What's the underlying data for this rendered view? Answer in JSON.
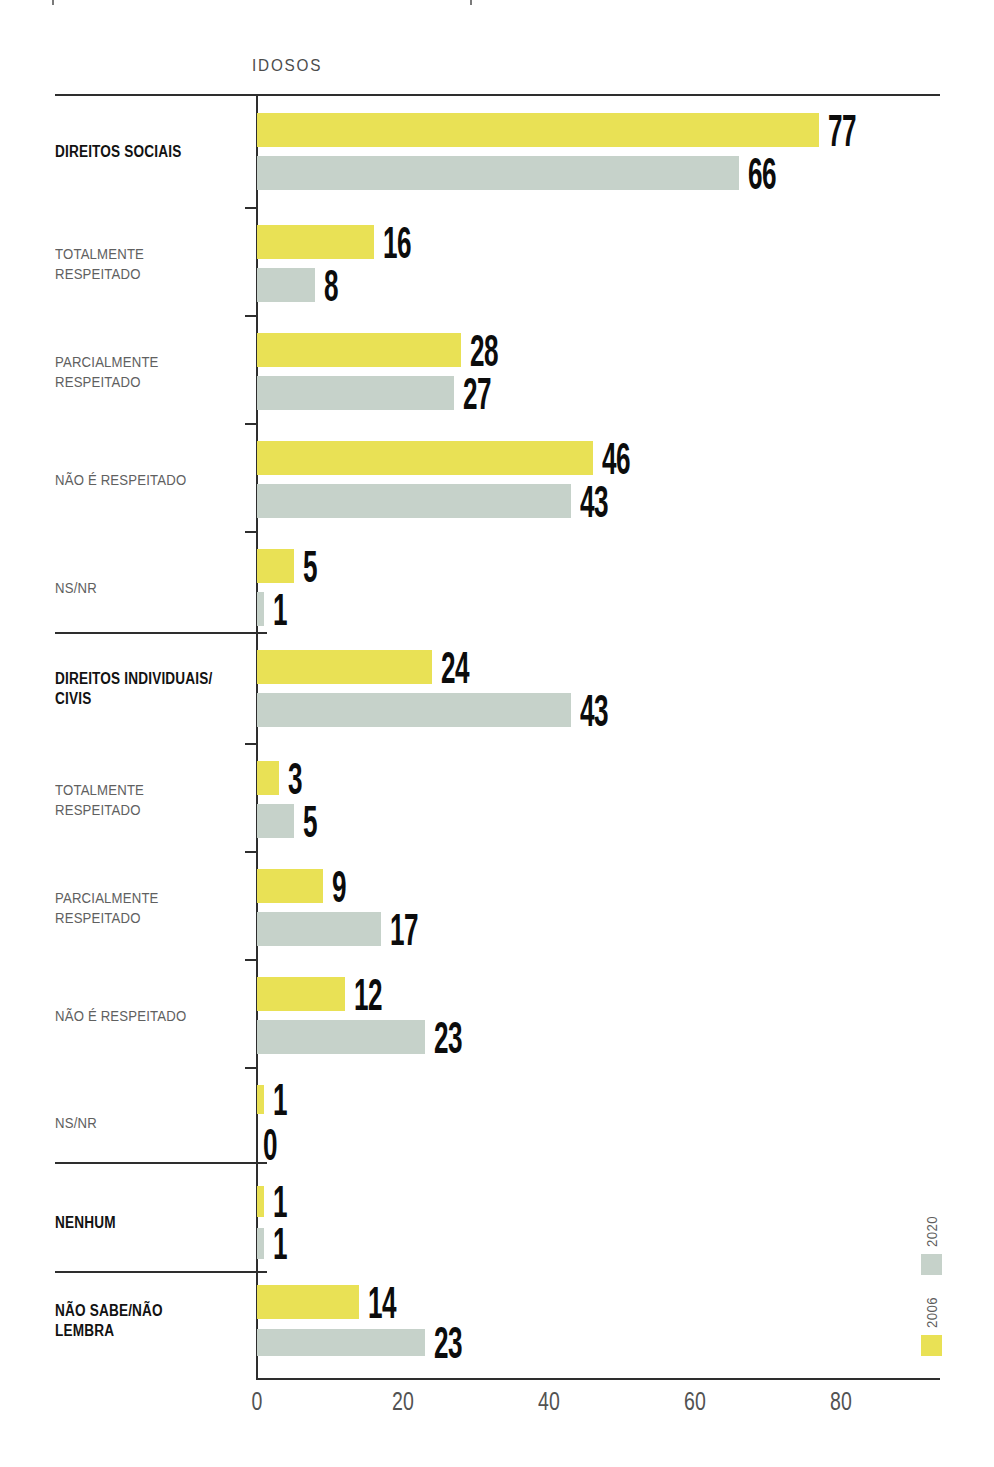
{
  "page": {
    "title": "IDOSOS"
  },
  "legend": {
    "items": [
      {
        "label": "2020",
        "color": "#c6d2ca"
      },
      {
        "label": "2006",
        "color": "#e9e155"
      }
    ]
  },
  "x_axis": {
    "tick_labels": [
      "0",
      "20",
      "40",
      "60",
      "80"
    ],
    "tick_values": [
      0,
      20,
      40,
      60,
      80
    ]
  },
  "chart_data": {
    "type": "bar",
    "orientation": "horizontal",
    "title": "IDOSOS",
    "xlabel": "",
    "ylabel": "",
    "units": "percent",
    "xlim": [
      0,
      93
    ],
    "x_ticks": [
      0,
      20,
      40,
      60,
      80
    ],
    "grid": false,
    "legend_position": "right-bottom-rotated",
    "bar_order_within_group_top_to_bottom": [
      "2006",
      "2020"
    ],
    "series": [
      {
        "name": "2006",
        "color": "#e9e155",
        "values": [
          77,
          16,
          28,
          46,
          5,
          24,
          3,
          9,
          12,
          1,
          1,
          14
        ]
      },
      {
        "name": "2020",
        "color": "#c6d2ca",
        "values": [
          66,
          8,
          27,
          43,
          1,
          43,
          5,
          17,
          23,
          0,
          1,
          23
        ]
      }
    ],
    "rows": [
      {
        "label": "DIREITOS SOCIAIS",
        "bold": true,
        "section_start": false,
        "values": {
          "2006": 77,
          "2020": 66
        }
      },
      {
        "label": "TOTALMENTE\nRESPEITADO",
        "bold": false,
        "section_start": false,
        "values": {
          "2006": 16,
          "2020": 8
        }
      },
      {
        "label": "PARCIALMENTE\nRESPEITADO",
        "bold": false,
        "section_start": false,
        "values": {
          "2006": 28,
          "2020": 27
        }
      },
      {
        "label": "NÃO É RESPEITADO",
        "bold": false,
        "section_start": false,
        "values": {
          "2006": 46,
          "2020": 43
        }
      },
      {
        "label": "NS/NR",
        "bold": false,
        "section_start": false,
        "values": {
          "2006": 5,
          "2020": 1
        }
      },
      {
        "label": "DIREITOS INDIVIDUAIS/\nCIVIS",
        "bold": true,
        "section_start": true,
        "values": {
          "2006": 24,
          "2020": 43
        }
      },
      {
        "label": "TOTALMENTE\nRESPEITADO",
        "bold": false,
        "section_start": false,
        "values": {
          "2006": 3,
          "2020": 5
        }
      },
      {
        "label": "PARCIALMENTE\nRESPEITADO",
        "bold": false,
        "section_start": false,
        "values": {
          "2006": 9,
          "2020": 17
        }
      },
      {
        "label": "NÃO É RESPEITADO",
        "bold": false,
        "section_start": false,
        "values": {
          "2006": 12,
          "2020": 23
        }
      },
      {
        "label": "NS/NR",
        "bold": false,
        "section_start": false,
        "values": {
          "2006": 1,
          "2020": 0
        }
      },
      {
        "label": "NENHUM",
        "bold": true,
        "section_start": true,
        "values": {
          "2006": 1,
          "2020": 1
        }
      },
      {
        "label": "NÃO SABE/NÃO LEMBRA",
        "bold": true,
        "section_start": true,
        "values": {
          "2006": 14,
          "2020": 23
        }
      }
    ]
  }
}
